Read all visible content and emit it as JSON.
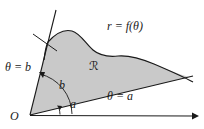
{
  "figure": {
    "colors": {
      "region_fill": "#c9c9c9",
      "stroke": "#1a1a1a",
      "background": "#ffffff"
    },
    "labels": {
      "curve": "r = f(θ)",
      "ray_lower": "θ = a",
      "ray_upper": "θ = b",
      "origin": "O",
      "angle_lower": "a",
      "angle_upper": "b",
      "region": "ℛ"
    },
    "geometry": {
      "origin": [
        30,
        115
      ],
      "axis_end": [
        197,
        116
      ],
      "ray_a_end": [
        189,
        77
      ],
      "ray_b_end": [
        56,
        10
      ],
      "curve_start": [
        48,
        42
      ],
      "curve_peak": [
        72,
        31
      ],
      "curve_end": [
        192,
        72
      ],
      "arc_b_radius": 30,
      "arc_a_radius": 42
    }
  }
}
